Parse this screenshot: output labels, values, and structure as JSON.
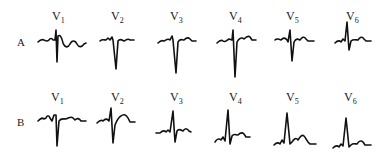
{
  "figure": {
    "rows": [
      {
        "label": "A",
        "leads": [
          {
            "name": "V",
            "sub": "1",
            "pattern": "rS with small r, deep narrow S, undulating T"
          },
          {
            "name": "V",
            "sub": "2",
            "pattern": "QS / deep S, small notch before"
          },
          {
            "name": "V",
            "sub": "3",
            "pattern": "small r, deep S"
          },
          {
            "name": "V",
            "sub": "4",
            "pattern": "small r, very deep S"
          },
          {
            "name": "V",
            "sub": "5",
            "pattern": "small r, moderate S"
          },
          {
            "name": "V",
            "sub": "6",
            "pattern": "tall narrow R, small S"
          }
        ]
      },
      {
        "label": "B",
        "leads": [
          {
            "name": "V",
            "sub": "1",
            "pattern": "notched rS, deep S"
          },
          {
            "name": "V",
            "sub": "2",
            "pattern": "RS, deep S"
          },
          {
            "name": "V",
            "sub": "3",
            "pattern": "tall R, S"
          },
          {
            "name": "V",
            "sub": "4",
            "pattern": "tall R, small s"
          },
          {
            "name": "V",
            "sub": "5",
            "pattern": "tall R, prominent T"
          },
          {
            "name": "V",
            "sub": "6",
            "pattern": "tall R, small T"
          }
        ]
      }
    ],
    "colors": {
      "trace": "#111111",
      "text": "#222222",
      "background": "#ffffff"
    }
  }
}
